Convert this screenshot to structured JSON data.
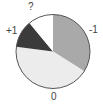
{
  "chart_data": {
    "type": "pie",
    "title": "",
    "start_angle_deg": 0,
    "direction": "clockwise",
    "slices": [
      {
        "label": "-1",
        "value": 34,
        "color": "#a9a9a9"
      },
      {
        "label": "0",
        "value": 43,
        "color": "#ececec"
      },
      {
        "label": "+1",
        "value": 12,
        "color": "#3b3b3b"
      },
      {
        "label": "?",
        "value": 11,
        "color": "#ffffff"
      }
    ],
    "categories": [
      "-1",
      "0",
      "+1",
      "?"
    ],
    "values": [
      34,
      43,
      12,
      11
    ],
    "border_color": "#555555"
  },
  "labels": {
    "minus_one": "-1",
    "zero": "0",
    "plus_one": "+1",
    "unknown": "?"
  }
}
